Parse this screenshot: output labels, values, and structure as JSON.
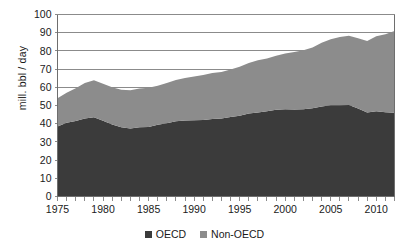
{
  "chart_data": {
    "type": "area",
    "stacked": true,
    "title": "",
    "subtitle": "",
    "xlabel": "",
    "ylabel": "mill. bbl / day",
    "ylim": [
      0,
      100
    ],
    "xlim": [
      1975,
      2012
    ],
    "ytick_step": 10,
    "yticks": [
      0,
      10,
      20,
      30,
      40,
      50,
      60,
      70,
      80,
      90,
      100
    ],
    "ytick_labels": [
      "0",
      "10",
      "20",
      "30",
      "40",
      "50",
      "60",
      "70",
      "80",
      "90",
      "100"
    ],
    "xticks": [
      1975,
      1980,
      1985,
      1990,
      1995,
      2000,
      2005,
      2010
    ],
    "xtick_labels": [
      "1975",
      "1980",
      "1985",
      "1990",
      "1995",
      "2000",
      "2005",
      "2010"
    ],
    "minor_xticks_every": 1,
    "grid": "horizontal",
    "legend_position": "bottom",
    "x": [
      1975,
      1976,
      1977,
      1978,
      1979,
      1980,
      1981,
      1982,
      1983,
      1984,
      1985,
      1986,
      1987,
      1988,
      1989,
      1990,
      1991,
      1992,
      1993,
      1994,
      1995,
      1996,
      1997,
      1998,
      1999,
      2000,
      2001,
      2002,
      2003,
      2004,
      2005,
      2006,
      2007,
      2008,
      2009,
      2010,
      2011,
      2012
    ],
    "series": [
      {
        "name": "OECD",
        "color": "#3b3b3b",
        "values": [
          38.5,
          40.5,
          41.5,
          42.8,
          43.6,
          41.6,
          39.6,
          38.0,
          37.3,
          38.0,
          38.2,
          39.4,
          40.2,
          41.3,
          41.8,
          41.9,
          42.0,
          42.6,
          42.8,
          43.7,
          44.4,
          45.6,
          46.2,
          46.9,
          47.6,
          47.9,
          47.8,
          47.9,
          48.5,
          49.4,
          50.1,
          50.2,
          50.3,
          48.3,
          46.2,
          46.8,
          46.3,
          46.0
        ]
      },
      {
        "name": "Non-OECD",
        "color": "#8c8c8c",
        "values": [
          15.5,
          16.5,
          18.0,
          19.5,
          20.3,
          20.4,
          20.4,
          20.6,
          21.1,
          21.4,
          21.6,
          21.5,
          22.1,
          22.7,
          23.3,
          24.1,
          24.7,
          25.2,
          25.6,
          26.1,
          26.9,
          27.7,
          28.7,
          28.9,
          29.7,
          30.7,
          31.6,
          32.5,
          33.3,
          35.1,
          36.3,
          37.4,
          38.0,
          38.6,
          39.2,
          41.2,
          42.8,
          45.0
        ]
      }
    ],
    "totals": [
      54.0,
      57.0,
      59.5,
      62.3,
      63.9,
      62.0,
      60.0,
      58.6,
      58.4,
      59.4,
      59.8,
      60.9,
      62.3,
      64.0,
      65.1,
      66.0,
      66.7,
      67.8,
      68.4,
      69.8,
      71.3,
      73.3,
      74.9,
      75.8,
      77.3,
      78.6,
      79.4,
      80.4,
      81.8,
      84.5,
      86.4,
      87.6,
      88.3,
      86.9,
      85.4,
      88.0,
      89.1,
      91.0
    ]
  },
  "legend": {
    "items": [
      {
        "label": "OECD",
        "color": "#3b3b3b"
      },
      {
        "label": "Non-OECD",
        "color": "#8c8c8c"
      }
    ]
  }
}
